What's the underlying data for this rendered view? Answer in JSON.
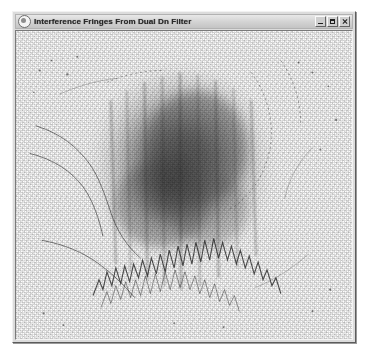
{
  "window": {
    "title": "Interference Fringes From Dual Dn Filter",
    "icon": "window-menu-icon",
    "buttons": [
      {
        "name": "minimize",
        "label": "_"
      },
      {
        "name": "maximize",
        "label": "□"
      },
      {
        "name": "close",
        "label": "×"
      }
    ]
  },
  "image": {
    "alt": "Interference fringe pattern photograph",
    "description": "Grainy dithered grayscale photograph of interference fringes from a dual neutral-density filter: a large dark diffuse blob centred in a speckled light field, with thin curved fringe lines and jagged dark fringe edges along the lower boundary.",
    "colors": {
      "background": "#fdfdfd",
      "blob_dark": "#4a4a4a",
      "blob_mid": "#8e8e8e",
      "speckle": "#2b2b2b",
      "window_face": "#dcdcdc",
      "titlebar": "#d2d2d2",
      "desktop": "#ffffff"
    }
  }
}
